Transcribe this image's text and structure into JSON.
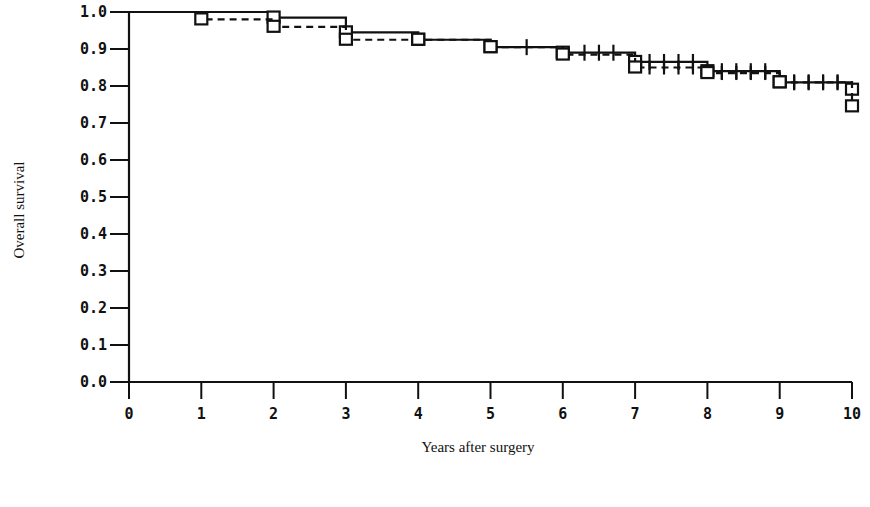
{
  "chart_data": {
    "type": "line",
    "subtype": "kaplan-meier step survival curves",
    "title": "",
    "xlabel": "Years after surgery",
    "ylabel": "Overall survival",
    "xlim": [
      0,
      10
    ],
    "ylim": [
      0.0,
      1.0
    ],
    "x_ticks": [
      "0",
      "1",
      "2",
      "3",
      "4",
      "5",
      "6",
      "7",
      "8",
      "9",
      "10"
    ],
    "y_ticks": [
      "0.0",
      "0.1",
      "0.2",
      "0.3",
      "0.4",
      "0.5",
      "0.6",
      "0.7",
      "0.8",
      "0.9",
      "1.0"
    ],
    "grid": false,
    "legend": null,
    "series": [
      {
        "name": "Group A (solid line)",
        "style": "solid",
        "marker": "square at yearly points, + censor ticks",
        "x": [
          0,
          2,
          3,
          4,
          5,
          6,
          7,
          8,
          9,
          10
        ],
        "values": [
          1.0,
          0.985,
          0.945,
          0.925,
          0.905,
          0.89,
          0.865,
          0.84,
          0.81,
          0.79
        ]
      },
      {
        "name": "Group B (dashed line)",
        "style": "dashed",
        "marker": "square at yearly points, + censor ticks",
        "x": [
          0,
          1,
          2,
          3,
          4,
          5,
          6,
          7,
          8,
          9,
          10
        ],
        "values": [
          1.0,
          0.98,
          0.96,
          0.925,
          0.925,
          0.905,
          0.885,
          0.85,
          0.835,
          0.81,
          0.745
        ]
      }
    ],
    "censor_marks_x_approx": [
      5.5,
      6.3,
      6.5,
      6.7,
      7.2,
      7.4,
      7.6,
      7.8,
      8.2,
      8.4,
      8.6,
      8.8,
      9.2,
      9.4,
      9.6,
      9.8
    ]
  }
}
